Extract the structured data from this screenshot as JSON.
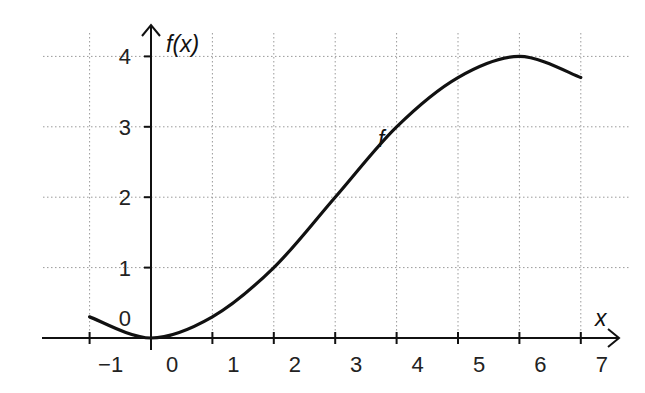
{
  "chart_data": {
    "type": "line",
    "title": "",
    "xlabel": "x",
    "ylabel": "f(x)",
    "series": [
      {
        "name": "f",
        "x": [
          -1,
          0,
          1,
          2,
          3,
          4,
          5,
          6,
          7
        ],
        "values": [
          0.3,
          0,
          0.3,
          1,
          2,
          3,
          3.7,
          4,
          3.7
        ]
      }
    ],
    "x_ticks": [
      -1,
      0,
      1,
      2,
      3,
      4,
      5,
      6,
      7
    ],
    "x_tick_labels": [
      "−1",
      "0",
      "1",
      "2",
      "3",
      "4",
      "5",
      "6",
      "7"
    ],
    "y_ticks": [
      0,
      1,
      2,
      3,
      4
    ],
    "y_tick_labels": [
      "0",
      "1",
      "2",
      "3",
      "4"
    ],
    "xlim": [
      -1.7,
      7.6
    ],
    "ylim": [
      0,
      4.4
    ],
    "grid": true,
    "legend": "none",
    "annotations": [
      {
        "text": "f",
        "x": 3.8,
        "y": 3.2
      }
    ]
  }
}
